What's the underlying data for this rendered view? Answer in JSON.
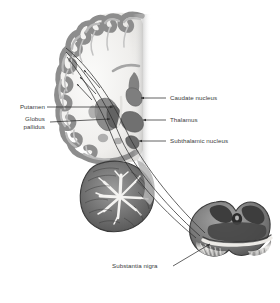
{
  "figure": {
    "background_color": "#ffffff",
    "ink_color": "#3b3b3b",
    "tissue_gray_mid": "#8a8a8a",
    "tissue_gray_dark": "#4e4e4e",
    "tissue_gray_light": "#d8d8d8",
    "white_matter_color": "#f2f1ef"
  },
  "labels": {
    "putamen": "Putamen",
    "globus_pallidus_line1": "Globus",
    "globus_pallidus_line2": "pallidus",
    "caudate_nucleus": "Caudate nucleus",
    "thalamus": "Thalamus",
    "subthalamic_nucleus": "Subthalamic nucleus",
    "substantia_nigra": "Substantia nigra"
  },
  "structures": {
    "cerebral_cortex": "cerebral-cortex",
    "white_matter": "cerebral-white-matter",
    "cerebellum": "cerebellum",
    "brainstem": "brainstem",
    "midbrain_inset": "midbrain-cross-section",
    "lateral_ventricle": "lateral-ventricle"
  },
  "tracts": {
    "count": 3,
    "description": "projection fibers from basal ganglia to cerebral cortex"
  }
}
